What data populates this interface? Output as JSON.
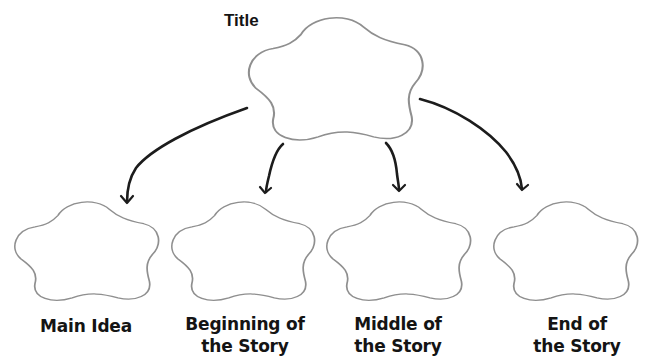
{
  "diagram": {
    "type": "story-map graphic organizer",
    "title_node": {
      "label": "Title"
    },
    "child_nodes": [
      {
        "id": "main-idea",
        "line1": "Main Idea",
        "line2": ""
      },
      {
        "id": "beginning",
        "line1": "Beginning of",
        "line2": "the Story"
      },
      {
        "id": "middle",
        "line1": "Middle of",
        "line2": "the Story"
      },
      {
        "id": "end",
        "line1": "End of",
        "line2": "the Story"
      }
    ],
    "edges": [
      {
        "from": "Title",
        "to": "Main Idea"
      },
      {
        "from": "Title",
        "to": "Beginning of the Story"
      },
      {
        "from": "Title",
        "to": "Middle of the Story"
      },
      {
        "from": "Title",
        "to": "End of the Story"
      }
    ],
    "colors": {
      "background": "#ffffff",
      "cloud_outline": "#8f8f8f",
      "arrow": "#1c1c1c",
      "text": "#141414"
    }
  }
}
